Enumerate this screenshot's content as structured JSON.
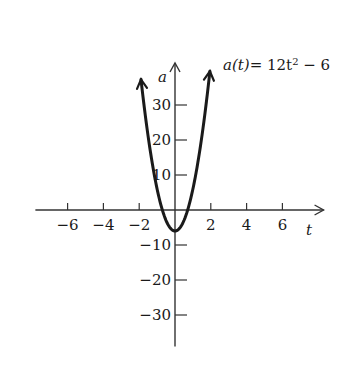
{
  "chart_data": {
    "type": "line",
    "title": "",
    "equation": {
      "lhs": "a(t)",
      "rhs_prefix": "= 12t",
      "exponent": "2",
      "rhs_suffix": " − 6"
    },
    "xlabel": "t",
    "ylabel": "a",
    "xlim": [
      -7.8,
      8.3
    ],
    "ylim": [
      -39,
      42
    ],
    "x_ticks": [
      -6,
      -4,
      -2,
      2,
      4,
      6
    ],
    "x_tick_labels": [
      "−6",
      "−4",
      "−2",
      "2",
      "4",
      "6"
    ],
    "y_ticks": [
      -30,
      -20,
      -10,
      10,
      20,
      30
    ],
    "y_tick_labels": [
      "−30",
      "−20",
      "−10",
      "10",
      "20",
      "30"
    ],
    "grid": false,
    "legend": null,
    "series": [
      {
        "name": "a(t) = 12t^2 − 6",
        "formula": "12*t^2 - 6",
        "t_range": [
          -1.9,
          1.95
        ],
        "color": "#1a1a1a",
        "endpoints_arrows": true
      }
    ],
    "sample_points": {
      "t": [
        -1.9,
        -1.5,
        -1,
        -0.5,
        0,
        0.5,
        1,
        1.5,
        1.95
      ],
      "a": [
        37.32,
        21,
        6,
        -3,
        -6,
        -3,
        6,
        21,
        39.63
      ]
    }
  },
  "colors": {
    "ink": "#1a1a1a",
    "axis": "#333333",
    "background": "#ffffff"
  }
}
